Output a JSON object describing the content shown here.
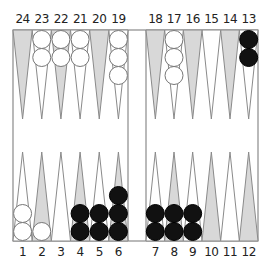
{
  "game": "Backgammon",
  "colors": {
    "board_bg": "#ffffff",
    "border": "#8a8a8a",
    "shaded_point": "#d8d8d8",
    "white_point": "#ffffff",
    "white_checker": "#ffffff",
    "black_checker": "#111111",
    "label": "#222222"
  },
  "labels": {
    "top": [
      "24",
      "23",
      "22",
      "21",
      "20",
      "19",
      "18",
      "17",
      "16",
      "15",
      "14",
      "13"
    ],
    "bottom": [
      "1",
      "2",
      "3",
      "4",
      "5",
      "6",
      "7",
      "8",
      "9",
      "10",
      "11",
      "12"
    ]
  },
  "points": [
    {
      "point": 1,
      "shaded": false,
      "checkers": {
        "color": "white",
        "count": 2
      }
    },
    {
      "point": 2,
      "shaded": true,
      "checkers": {
        "color": "white",
        "count": 1
      }
    },
    {
      "point": 3,
      "shaded": false,
      "checkers": {
        "color": "none",
        "count": 0
      }
    },
    {
      "point": 4,
      "shaded": true,
      "checkers": {
        "color": "black",
        "count": 2
      }
    },
    {
      "point": 5,
      "shaded": false,
      "checkers": {
        "color": "black",
        "count": 2
      }
    },
    {
      "point": 6,
      "shaded": true,
      "checkers": {
        "color": "black",
        "count": 3
      }
    },
    {
      "point": 7,
      "shaded": false,
      "checkers": {
        "color": "black",
        "count": 2
      }
    },
    {
      "point": 8,
      "shaded": true,
      "checkers": {
        "color": "black",
        "count": 2
      }
    },
    {
      "point": 9,
      "shaded": false,
      "checkers": {
        "color": "black",
        "count": 2
      }
    },
    {
      "point": 10,
      "shaded": true,
      "checkers": {
        "color": "none",
        "count": 0
      }
    },
    {
      "point": 11,
      "shaded": false,
      "checkers": {
        "color": "none",
        "count": 0
      }
    },
    {
      "point": 12,
      "shaded": true,
      "checkers": {
        "color": "none",
        "count": 0
      }
    },
    {
      "point": 13,
      "shaded": false,
      "checkers": {
        "color": "black",
        "count": 2
      }
    },
    {
      "point": 14,
      "shaded": true,
      "checkers": {
        "color": "none",
        "count": 0
      }
    },
    {
      "point": 15,
      "shaded": false,
      "checkers": {
        "color": "none",
        "count": 0
      }
    },
    {
      "point": 16,
      "shaded": true,
      "checkers": {
        "color": "none",
        "count": 0
      }
    },
    {
      "point": 17,
      "shaded": false,
      "checkers": {
        "color": "white",
        "count": 3
      }
    },
    {
      "point": 18,
      "shaded": true,
      "checkers": {
        "color": "none",
        "count": 0
      }
    },
    {
      "point": 19,
      "shaded": false,
      "checkers": {
        "color": "white",
        "count": 3
      }
    },
    {
      "point": 20,
      "shaded": true,
      "checkers": {
        "color": "none",
        "count": 0
      }
    },
    {
      "point": 21,
      "shaded": false,
      "checkers": {
        "color": "white",
        "count": 2
      }
    },
    {
      "point": 22,
      "shaded": true,
      "checkers": {
        "color": "white",
        "count": 2
      }
    },
    {
      "point": 23,
      "shaded": false,
      "checkers": {
        "color": "white",
        "count": 2
      }
    },
    {
      "point": 24,
      "shaded": true,
      "checkers": {
        "color": "none",
        "count": 0
      }
    }
  ]
}
